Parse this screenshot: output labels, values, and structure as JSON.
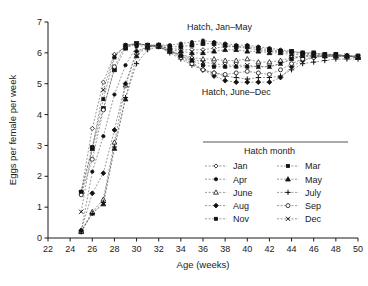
{
  "chart_data": {
    "type": "line",
    "title": "",
    "xlabel": "Age (weeks)",
    "ylabel": "Eggs per female per week",
    "xlim": [
      22,
      50
    ],
    "ylim": [
      0,
      7
    ],
    "xticks": [
      22,
      24,
      26,
      28,
      30,
      32,
      34,
      36,
      38,
      40,
      42,
      44,
      46,
      48,
      50
    ],
    "yticks": [
      0,
      1,
      2,
      3,
      4,
      5,
      6,
      7
    ],
    "grid": false,
    "legend_position": "inside-lower-right",
    "legend_title": "Hatch month",
    "annotations": [
      {
        "text": "Hatch, Jan–May",
        "x": 37.5,
        "y": 6.75
      },
      {
        "text": "Hatch, June–Dec",
        "x": 39.0,
        "y": 4.65
      }
    ],
    "x": [
      25,
      26,
      27,
      28,
      29,
      30,
      31,
      32,
      33,
      34,
      35,
      36,
      37,
      38,
      39,
      40,
      41,
      42,
      43,
      44,
      45,
      46,
      47,
      48,
      49,
      50
    ],
    "series": [
      {
        "name": "Jan",
        "marker": "open-diamond",
        "group": "Jan-May",
        "values": [
          1.5,
          3.55,
          5.05,
          5.95,
          6.2,
          6.3,
          6.25,
          6.2,
          6.15,
          6.1,
          6.1,
          6.1,
          6.15,
          6.2,
          6.2,
          6.15,
          6.1,
          6.05,
          6.05,
          6.0,
          6.0,
          5.95,
          5.95,
          5.95,
          5.9,
          5.9
        ]
      },
      {
        "name": "Mar",
        "marker": "filled-square",
        "group": "Jan-May",
        "values": [
          1.48,
          2.9,
          4.2,
          5.45,
          6.15,
          6.3,
          6.25,
          6.25,
          6.2,
          6.2,
          6.25,
          6.3,
          6.3,
          6.25,
          6.2,
          6.2,
          6.15,
          6.1,
          6.05,
          6.05,
          6.0,
          6.0,
          5.95,
          5.95,
          5.9,
          5.9
        ]
      },
      {
        "name": "Apr",
        "marker": "filled-dot",
        "group": "Jan-May",
        "values": [
          0.22,
          2.15,
          3.3,
          4.65,
          5.6,
          6.2,
          6.25,
          6.25,
          6.25,
          6.3,
          6.35,
          6.4,
          6.35,
          6.3,
          6.25,
          6.25,
          6.2,
          6.15,
          6.1,
          6.05,
          6.0,
          6.0,
          5.95,
          5.95,
          5.9,
          5.9
        ]
      },
      {
        "name": "May",
        "marker": "filled-triangle",
        "group": "Jan-May",
        "values": [
          0.2,
          0.8,
          1.1,
          2.9,
          4.5,
          5.9,
          6.2,
          6.25,
          6.1,
          6.05,
          6.0,
          6.0,
          6.05,
          6.1,
          6.1,
          6.05,
          6.05,
          6.0,
          6.0,
          5.95,
          5.95,
          5.95,
          5.9,
          5.9,
          5.9,
          5.85
        ]
      },
      {
        "name": "June",
        "marker": "open-triangle",
        "group": "June-Dec",
        "values": [
          0.22,
          0.85,
          1.25,
          3.1,
          4.95,
          6.0,
          6.2,
          6.2,
          6.05,
          5.95,
          5.85,
          5.8,
          5.8,
          5.75,
          5.75,
          5.8,
          5.7,
          5.7,
          5.75,
          5.85,
          5.9,
          5.9,
          5.9,
          5.9,
          5.9,
          5.85
        ]
      },
      {
        "name": "July",
        "marker": "plus",
        "group": "June-Dec",
        "values": [
          0.2,
          0.8,
          1.15,
          2.95,
          4.55,
          5.65,
          6.1,
          6.2,
          6.0,
          5.8,
          5.6,
          5.45,
          5.35,
          5.25,
          5.2,
          5.15,
          5.2,
          5.2,
          5.25,
          5.45,
          5.65,
          5.7,
          5.75,
          5.8,
          5.8,
          5.8
        ]
      },
      {
        "name": "Aug",
        "marker": "filled-diamond",
        "group": "June-Dec",
        "values": [
          0.25,
          1.45,
          2.1,
          3.5,
          5.0,
          6.05,
          6.2,
          6.25,
          6.1,
          5.9,
          5.7,
          5.45,
          5.25,
          5.1,
          5.05,
          5.05,
          5.05,
          5.05,
          5.2,
          5.55,
          5.75,
          5.85,
          5.9,
          5.9,
          5.9,
          5.85
        ]
      },
      {
        "name": "Sep",
        "marker": "open-circle",
        "group": "June-Dec",
        "values": [
          1.4,
          2.55,
          4.15,
          5.55,
          6.25,
          6.3,
          6.25,
          6.2,
          6.05,
          5.85,
          5.65,
          5.45,
          5.35,
          5.3,
          5.35,
          5.4,
          5.35,
          5.3,
          5.45,
          5.65,
          5.8,
          5.85,
          5.9,
          5.9,
          5.9,
          5.85
        ]
      },
      {
        "name": "Nov",
        "marker": "filled-square-sm",
        "group": "June-Dec",
        "values": [
          1.5,
          2.95,
          4.5,
          5.85,
          6.25,
          6.3,
          6.25,
          6.2,
          6.05,
          5.9,
          5.75,
          5.6,
          5.55,
          5.55,
          5.55,
          5.55,
          5.55,
          5.55,
          5.65,
          5.8,
          5.9,
          5.9,
          5.9,
          5.9,
          5.9,
          5.85
        ]
      },
      {
        "name": "Dec",
        "marker": "cross-x",
        "group": "June-Dec",
        "values": [
          0.85,
          2.9,
          4.8,
          5.9,
          6.2,
          6.3,
          6.25,
          6.2,
          6.05,
          5.95,
          5.8,
          5.7,
          5.65,
          5.6,
          5.6,
          5.6,
          5.55,
          5.55,
          5.65,
          5.8,
          5.9,
          5.9,
          5.9,
          5.9,
          5.9,
          5.85
        ]
      }
    ],
    "legend_entries": [
      {
        "label": "Jan",
        "marker": "open-diamond",
        "col": 0,
        "row": 0
      },
      {
        "label": "Mar",
        "marker": "filled-square-sm",
        "col": 1,
        "row": 0
      },
      {
        "label": "Apr",
        "marker": "filled-dot",
        "col": 0,
        "row": 1
      },
      {
        "label": "May",
        "marker": "filled-triangle",
        "col": 1,
        "row": 1
      },
      {
        "label": "June",
        "marker": "open-triangle",
        "col": 0,
        "row": 2
      },
      {
        "label": "July",
        "marker": "plus",
        "col": 1,
        "row": 2
      },
      {
        "label": "Aug",
        "marker": "filled-diamond",
        "col": 0,
        "row": 3
      },
      {
        "label": "Sep",
        "marker": "open-circle",
        "col": 1,
        "row": 3
      },
      {
        "label": "Nov",
        "marker": "filled-square-sm",
        "col": 0,
        "row": 4
      },
      {
        "label": "Dec",
        "marker": "cross-x",
        "col": 1,
        "row": 4
      }
    ],
    "colors": {
      "line": "#555555",
      "marker": "#111111",
      "axis": "#1a1a1a",
      "background": "#ffffff"
    }
  }
}
